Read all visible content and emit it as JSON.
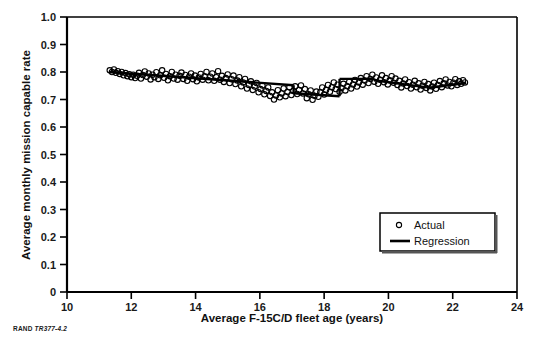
{
  "figure": {
    "source_note_brand": "RAND",
    "source_note_id": "TR377-4.2"
  },
  "legend": {
    "actual_label": "Actual",
    "regression_label": "Regression"
  },
  "chart_data": {
    "type": "scatter",
    "title": "",
    "xlabel": "Average F-15C/D fleet age (years)",
    "ylabel": "Average monthly mission capable rate",
    "xlim": [
      10,
      24
    ],
    "ylim": [
      0,
      1.0
    ],
    "xticks": [
      10,
      12,
      14,
      16,
      18,
      20,
      22,
      24
    ],
    "xtick_labels": [
      "10",
      "12",
      "14",
      "16",
      "18",
      "20",
      "22",
      "24"
    ],
    "yticks": [
      0,
      0.1,
      0.2,
      0.3,
      0.4,
      0.5,
      0.6,
      0.7,
      0.8,
      0.9,
      1.0
    ],
    "ytick_labels": [
      "0",
      "0.1",
      "0.2",
      "0.3",
      "0.4",
      "0.5",
      "0.6",
      "0.7",
      "0.8",
      "0.9",
      "1.0"
    ],
    "grid": false,
    "legend_position": "lower right",
    "marker_color": "#000000",
    "line_color": "#000000",
    "series": [
      {
        "name": "Actual",
        "type": "scatter",
        "marker": "open-circle",
        "points": [
          [
            11.33,
            0.806
          ],
          [
            11.4,
            0.8
          ],
          [
            11.46,
            0.809
          ],
          [
            11.52,
            0.797
          ],
          [
            11.58,
            0.803
          ],
          [
            11.64,
            0.793
          ],
          [
            11.7,
            0.8
          ],
          [
            11.76,
            0.788
          ],
          [
            11.82,
            0.796
          ],
          [
            11.88,
            0.785
          ],
          [
            11.94,
            0.792
          ],
          [
            12.0,
            0.781
          ],
          [
            12.06,
            0.79
          ],
          [
            12.12,
            0.778
          ],
          [
            12.18,
            0.786
          ],
          [
            12.24,
            0.797
          ],
          [
            12.3,
            0.776
          ],
          [
            12.36,
            0.789
          ],
          [
            12.42,
            0.802
          ],
          [
            12.48,
            0.783
          ],
          [
            12.54,
            0.795
          ],
          [
            12.6,
            0.773
          ],
          [
            12.66,
            0.79
          ],
          [
            12.72,
            0.781
          ],
          [
            12.78,
            0.799
          ],
          [
            12.84,
            0.775
          ],
          [
            12.9,
            0.788
          ],
          [
            12.96,
            0.806
          ],
          [
            13.02,
            0.779
          ],
          [
            13.08,
            0.793
          ],
          [
            13.14,
            0.77
          ],
          [
            13.2,
            0.785
          ],
          [
            13.26,
            0.8
          ],
          [
            13.32,
            0.776
          ],
          [
            13.38,
            0.79
          ],
          [
            13.44,
            0.772
          ],
          [
            13.5,
            0.786
          ],
          [
            13.56,
            0.798
          ],
          [
            13.62,
            0.775
          ],
          [
            13.68,
            0.789
          ],
          [
            13.74,
            0.768
          ],
          [
            13.8,
            0.783
          ],
          [
            13.86,
            0.795
          ],
          [
            13.92,
            0.774
          ],
          [
            13.98,
            0.787
          ],
          [
            14.04,
            0.766
          ],
          [
            14.1,
            0.78
          ],
          [
            14.16,
            0.793
          ],
          [
            14.22,
            0.772
          ],
          [
            14.28,
            0.785
          ],
          [
            14.34,
            0.8
          ],
          [
            14.4,
            0.77
          ],
          [
            14.46,
            0.783
          ],
          [
            14.52,
            0.795
          ],
          [
            14.58,
            0.768
          ],
          [
            14.64,
            0.781
          ],
          [
            14.7,
            0.803
          ],
          [
            14.76,
            0.772
          ],
          [
            14.82,
            0.786
          ],
          [
            14.88,
            0.764
          ],
          [
            14.94,
            0.778
          ],
          [
            15.0,
            0.791
          ],
          [
            15.06,
            0.76
          ],
          [
            15.12,
            0.774
          ],
          [
            15.18,
            0.787
          ],
          [
            15.24,
            0.756
          ],
          [
            15.3,
            0.769
          ],
          [
            15.36,
            0.781
          ],
          [
            15.42,
            0.748
          ],
          [
            15.48,
            0.762
          ],
          [
            15.54,
            0.775
          ],
          [
            15.6,
            0.74
          ],
          [
            15.66,
            0.753
          ],
          [
            15.72,
            0.766
          ],
          [
            15.78,
            0.735
          ],
          [
            15.84,
            0.747
          ],
          [
            15.9,
            0.76
          ],
          [
            15.96,
            0.726
          ],
          [
            16.02,
            0.738
          ],
          [
            16.08,
            0.751
          ],
          [
            16.14,
            0.719
          ],
          [
            16.2,
            0.731
          ],
          [
            16.26,
            0.744
          ],
          [
            16.32,
            0.713
          ],
          [
            16.38,
            0.726
          ],
          [
            16.44,
            0.7
          ],
          [
            16.5,
            0.715
          ],
          [
            16.56,
            0.734
          ],
          [
            16.62,
            0.708
          ],
          [
            16.68,
            0.722
          ],
          [
            16.74,
            0.74
          ],
          [
            16.8,
            0.712
          ],
          [
            16.86,
            0.727
          ],
          [
            16.92,
            0.745
          ],
          [
            16.98,
            0.716
          ],
          [
            17.04,
            0.731
          ],
          [
            17.1,
            0.748
          ],
          [
            17.16,
            0.72
          ],
          [
            17.22,
            0.735
          ],
          [
            17.28,
            0.751
          ],
          [
            17.34,
            0.722
          ],
          [
            17.4,
            0.738
          ],
          [
            17.46,
            0.705
          ],
          [
            17.52,
            0.719
          ],
          [
            17.58,
            0.733
          ],
          [
            17.64,
            0.699
          ],
          [
            17.7,
            0.714
          ],
          [
            17.76,
            0.729
          ],
          [
            17.82,
            0.71
          ],
          [
            17.88,
            0.726
          ],
          [
            17.94,
            0.744
          ],
          [
            18.0,
            0.718
          ],
          [
            18.06,
            0.735
          ],
          [
            18.12,
            0.753
          ],
          [
            18.18,
            0.728
          ],
          [
            18.24,
            0.745
          ],
          [
            18.3,
            0.762
          ],
          [
            18.36,
            0.738
          ],
          [
            18.42,
            0.754
          ],
          [
            18.48,
            0.728
          ],
          [
            18.54,
            0.742
          ],
          [
            18.6,
            0.757
          ],
          [
            18.66,
            0.733
          ],
          [
            18.72,
            0.748
          ],
          [
            18.78,
            0.764
          ],
          [
            18.84,
            0.74
          ],
          [
            18.9,
            0.755
          ],
          [
            18.96,
            0.771
          ],
          [
            19.02,
            0.747
          ],
          [
            19.08,
            0.762
          ],
          [
            19.14,
            0.778
          ],
          [
            19.2,
            0.754
          ],
          [
            19.26,
            0.769
          ],
          [
            19.32,
            0.785
          ],
          [
            19.38,
            0.76
          ],
          [
            19.44,
            0.775
          ],
          [
            19.5,
            0.79
          ],
          [
            19.56,
            0.765
          ],
          [
            19.62,
            0.78
          ],
          [
            19.68,
            0.757
          ],
          [
            19.74,
            0.772
          ],
          [
            19.8,
            0.788
          ],
          [
            19.86,
            0.763
          ],
          [
            19.92,
            0.778
          ],
          [
            19.98,
            0.755
          ],
          [
            20.04,
            0.77
          ],
          [
            20.1,
            0.785
          ],
          [
            20.16,
            0.761
          ],
          [
            20.22,
            0.776
          ],
          [
            20.28,
            0.753
          ],
          [
            20.34,
            0.768
          ],
          [
            20.4,
            0.744
          ],
          [
            20.46,
            0.758
          ],
          [
            20.52,
            0.773
          ],
          [
            20.58,
            0.749
          ],
          [
            20.64,
            0.763
          ],
          [
            20.7,
            0.74
          ],
          [
            20.76,
            0.754
          ],
          [
            20.82,
            0.768
          ],
          [
            20.88,
            0.745
          ],
          [
            20.94,
            0.759
          ],
          [
            21.0,
            0.736
          ],
          [
            21.06,
            0.75
          ],
          [
            21.12,
            0.764
          ],
          [
            21.18,
            0.742
          ],
          [
            21.24,
            0.756
          ],
          [
            21.3,
            0.733
          ],
          [
            21.36,
            0.747
          ],
          [
            21.42,
            0.761
          ],
          [
            21.48,
            0.739
          ],
          [
            21.54,
            0.753
          ],
          [
            21.6,
            0.767
          ],
          [
            21.66,
            0.745
          ],
          [
            21.72,
            0.759
          ],
          [
            21.78,
            0.773
          ],
          [
            21.84,
            0.751
          ],
          [
            21.9,
            0.764
          ],
          [
            21.96,
            0.748
          ],
          [
            22.02,
            0.761
          ],
          [
            22.08,
            0.774
          ],
          [
            22.14,
            0.753
          ],
          [
            22.2,
            0.766
          ],
          [
            22.26,
            0.757
          ],
          [
            22.32,
            0.77
          ],
          [
            22.38,
            0.762
          ]
        ]
      },
      {
        "name": "Regression",
        "type": "line",
        "segments": [
          [
            [
              11.3,
              0.8
            ],
            [
              17.05,
              0.752
            ]
          ],
          [
            [
              17.05,
              0.723
            ],
            [
              18.48,
              0.712
            ]
          ],
          [
            [
              18.48,
              0.775
            ],
            [
              19.55,
              0.775
            ]
          ],
          [
            [
              19.55,
              0.77
            ],
            [
              21.2,
              0.744
            ]
          ],
          [
            [
              21.2,
              0.742
            ],
            [
              22.42,
              0.76
            ]
          ]
        ]
      }
    ]
  }
}
